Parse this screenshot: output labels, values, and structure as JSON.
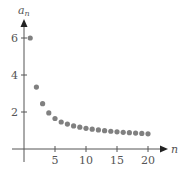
{
  "chart_data": {
    "type": "scatter",
    "title": "",
    "xlabel": "n",
    "ylabel": "a_n",
    "ylabel_main": "a",
    "ylabel_sub": "n",
    "x_ticks": [
      5,
      10,
      15,
      20
    ],
    "y_ticks": [
      2,
      4,
      6
    ],
    "x_tick_labels": [
      "5",
      "10",
      "15",
      "20"
    ],
    "y_tick_labels": [
      "2",
      "4",
      "6"
    ],
    "xlim": [
      0,
      22
    ],
    "ylim": [
      0,
      7
    ],
    "grid": false,
    "legend": null,
    "series": [
      {
        "name": "a_n",
        "color": "#808080",
        "x": [
          1,
          2,
          3,
          4,
          5,
          6,
          7,
          8,
          9,
          10,
          11,
          12,
          13,
          14,
          15,
          16,
          17,
          18,
          19,
          20
        ],
        "values": [
          6.0,
          3.35,
          2.45,
          1.95,
          1.65,
          1.46,
          1.35,
          1.25,
          1.18,
          1.12,
          1.07,
          1.03,
          0.99,
          0.96,
          0.93,
          0.9,
          0.88,
          0.86,
          0.84,
          0.82
        ]
      }
    ]
  },
  "style": {
    "axis_color": "#555555",
    "point_color": "#808080"
  }
}
